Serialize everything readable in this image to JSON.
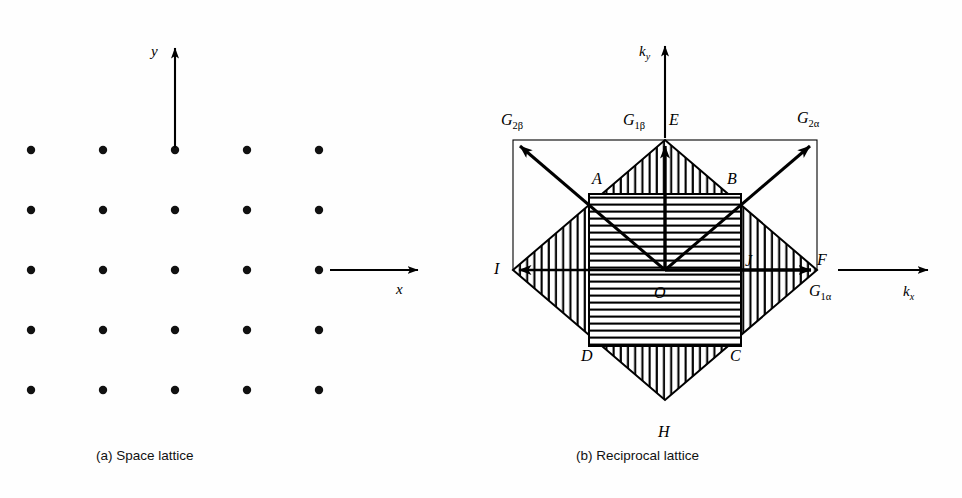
{
  "figure": {
    "panels": [
      {
        "id": "a",
        "caption": "(a)  Space lattice",
        "axes": [
          {
            "name": "y-axis",
            "label": "y"
          },
          {
            "name": "x-axis",
            "label": "x"
          }
        ],
        "lattice": {
          "rows": 5,
          "cols": 5,
          "x_positions": [
            31,
            103,
            175,
            247,
            319
          ],
          "y_positions": [
            150,
            210,
            270,
            330,
            390
          ]
        }
      },
      {
        "id": "b",
        "caption": "(b)  Reciprocal lattice",
        "axes": [
          {
            "name": "ky-axis",
            "label": "k",
            "sub": "y"
          },
          {
            "name": "kx-axis",
            "label": "k",
            "sub": "x"
          }
        ],
        "vectors": [
          {
            "name": "G1alpha",
            "label": "G",
            "sub": "1α"
          },
          {
            "name": "G1beta",
            "label": "G",
            "sub": "1β"
          },
          {
            "name": "G2alpha",
            "label": "G",
            "sub": "2α"
          },
          {
            "name": "G2beta",
            "label": "G",
            "sub": "2β"
          }
        ],
        "points": [
          {
            "name": "A",
            "label": "A"
          },
          {
            "name": "B",
            "label": "B"
          },
          {
            "name": "C",
            "label": "C"
          },
          {
            "name": "D",
            "label": "D"
          },
          {
            "name": "E",
            "label": "E"
          },
          {
            "name": "F",
            "label": "F"
          },
          {
            "name": "H",
            "label": "H"
          },
          {
            "name": "I",
            "label": "I"
          },
          {
            "name": "J",
            "label": "J"
          },
          {
            "name": "O",
            "label": "O"
          }
        ]
      }
    ],
    "colors": {
      "ink": "#000000",
      "background": "#fefefe"
    }
  }
}
